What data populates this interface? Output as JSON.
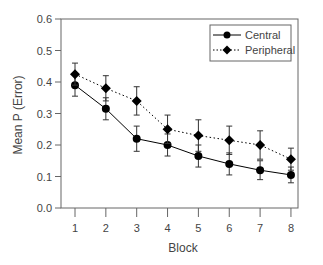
{
  "chart_data": {
    "type": "line",
    "title": "",
    "xlabel": "Block",
    "ylabel": "Mean P (Error)",
    "x": [
      1,
      2,
      3,
      4,
      5,
      6,
      7,
      8
    ],
    "ylim": [
      0.0,
      0.6
    ],
    "yticks": [
      "0.0",
      "0.1",
      "0.2",
      "0.3",
      "0.4",
      "0.5",
      "0.6"
    ],
    "xticks": [
      "1",
      "2",
      "3",
      "4",
      "5",
      "6",
      "7",
      "8"
    ],
    "grid": false,
    "legend_position": "upper right",
    "series": [
      {
        "name": "Central",
        "line_style": "solid",
        "marker": "circle",
        "values": [
          0.39,
          0.315,
          0.22,
          0.2,
          0.165,
          0.14,
          0.12,
          0.105
        ],
        "error": [
          0.035,
          0.035,
          0.04,
          0.035,
          0.035,
          0.035,
          0.03,
          0.025
        ]
      },
      {
        "name": "Peripheral",
        "line_style": "dotted",
        "marker": "diamond",
        "values": [
          0.425,
          0.38,
          0.34,
          0.25,
          0.23,
          0.215,
          0.2,
          0.155
        ],
        "error": [
          0.035,
          0.04,
          0.045,
          0.045,
          0.05,
          0.045,
          0.045,
          0.035
        ]
      }
    ]
  },
  "legend": {
    "items": [
      "Central",
      "Peripheral"
    ]
  },
  "colors": {
    "axis": "#555555",
    "series": "#000000",
    "text": "#444444"
  }
}
